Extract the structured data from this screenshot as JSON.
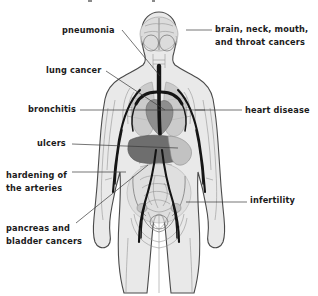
{
  "figure": {
    "title_fragment": "",
    "background_color": "#ffffff",
    "body_fill_color": "#e9e9e9",
    "body_outline_color": "#4a4a4a",
    "vessel_color": "#141414",
    "label_color": "#1b1b1b",
    "leader_color": "#3a3a3a"
  },
  "labels": [
    {
      "id": "pneumonia",
      "text": "pneumonia",
      "lines": [
        "pneumonia"
      ],
      "side": "left",
      "text_x": 62,
      "text_y": 33,
      "anchor": "start",
      "leader": "M 122,30 L 160,76",
      "target_organ": "lungs"
    },
    {
      "id": "lung-cancer",
      "text": "lung cancer",
      "lines": [
        "lung cancer"
      ],
      "side": "left",
      "text_x": 46,
      "text_y": 73,
      "anchor": "start",
      "leader": "M 106,71 L 165,110",
      "target_organ": "lung"
    },
    {
      "id": "bronchitis",
      "text": "bronchitis",
      "lines": [
        "bronchitis"
      ],
      "side": "left",
      "text_x": 28,
      "text_y": 112,
      "anchor": "start",
      "leader": "M 80,110 L 205,110",
      "target_organ": "bronchi"
    },
    {
      "id": "ulcers",
      "text": "ulcers",
      "lines": [
        "ulcers"
      ],
      "side": "left",
      "text_x": 37,
      "text_y": 146,
      "anchor": "start",
      "leader": "M 72,144 L 178,148",
      "target_organ": "stomach"
    },
    {
      "id": "hardening-of-the-arteries",
      "text": "hardening of the arteries",
      "lines": [
        "hardening of",
        "the arteries"
      ],
      "side": "left",
      "text_x": 6,
      "text_y": 178,
      "anchor": "start",
      "leader": "M 72,172 L 126,172",
      "target_organ": "arteries"
    },
    {
      "id": "pancreas-and-bladder-cancers",
      "text": "pancreas and bladder cancers",
      "lines": [
        "pancreas and",
        "bladder cancers"
      ],
      "side": "left",
      "text_x": 6,
      "text_y": 231,
      "anchor": "start",
      "leader": "M 76,223 L 148,165",
      "target_organ": "pancreas-bladder"
    },
    {
      "id": "brain-neck-mouth-and-throat-cancers",
      "text": "brain, neck, mouth, and throat cancers",
      "lines": [
        "brain, neck, mouth,",
        "and throat cancers"
      ],
      "side": "right",
      "text_x": 215,
      "text_y": 32,
      "anchor": "start",
      "leader": "M 186,30 L 212,30",
      "target_organ": "brain"
    },
    {
      "id": "heart-disease",
      "text": "heart disease",
      "lines": [
        "heart disease"
      ],
      "side": "right",
      "text_x": 245,
      "text_y": 113,
      "anchor": "start",
      "leader": "M 195,110 L 242,110",
      "target_organ": "heart"
    },
    {
      "id": "infertility",
      "text": "infertility",
      "lines": [
        "infertility"
      ],
      "side": "right",
      "text_x": 250,
      "text_y": 203,
      "anchor": "start",
      "leader": "M 186,202 L 247,202",
      "target_organ": "reproductive-organs"
    }
  ],
  "organs": [
    {
      "name": "brain",
      "tone": "light"
    },
    {
      "name": "trachea",
      "tone": "very-dark"
    },
    {
      "name": "lungs",
      "tone": "mid"
    },
    {
      "name": "heart",
      "tone": "dark"
    },
    {
      "name": "liver",
      "tone": "dark"
    },
    {
      "name": "stomach",
      "tone": "mid"
    },
    {
      "name": "intestines",
      "tone": "light"
    },
    {
      "name": "uterus",
      "tone": "light"
    },
    {
      "name": "pelvis",
      "tone": "light"
    },
    {
      "name": "arteries",
      "tone": "very-dark"
    }
  ]
}
